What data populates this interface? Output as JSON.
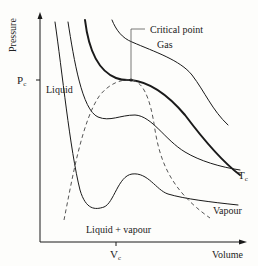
{
  "diagram": {
    "axes": {
      "y_label": "Pressure",
      "x_label": "Volume",
      "y_tick": {
        "main": "P",
        "sub": "c"
      },
      "x_tick": {
        "main": "V",
        "sub": "c"
      }
    },
    "regions": {
      "liquid": "Liquid",
      "gas": "Gas",
      "vapour": "Vapour",
      "liquid_vapour": "Liquid + vapour"
    },
    "annotations": {
      "critical_point": "Critical point",
      "critical_isotherm": {
        "main": "T",
        "sub": "c"
      }
    },
    "colors": {
      "line": "#1a1a1a",
      "dashed": "#555555",
      "background": "#fdfdfb"
    }
  }
}
